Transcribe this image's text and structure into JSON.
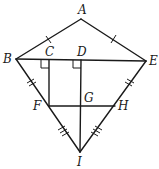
{
  "diagram": {
    "type": "kite-geometry",
    "points": {
      "A": {
        "label": "A",
        "x": 81,
        "y": 19
      },
      "B": {
        "label": "B",
        "x": 16,
        "y": 59
      },
      "C": {
        "label": "C",
        "x": 49,
        "y": 60
      },
      "D": {
        "label": "D",
        "x": 81,
        "y": 60
      },
      "E": {
        "label": "E",
        "x": 146,
        "y": 61
      },
      "F": {
        "label": "F",
        "x": 49,
        "y": 106
      },
      "G": {
        "label": "G",
        "x": 81,
        "y": 106
      },
      "H": {
        "label": "H",
        "x": 115,
        "y": 106
      },
      "I": {
        "label": "I",
        "x": 80,
        "y": 152
      }
    },
    "segments": [
      "AB",
      "AE",
      "BE",
      "BI",
      "EI",
      "CF",
      "DI",
      "FH"
    ],
    "congruence_marks": [
      {
        "segments": [
          "AB",
          "AE"
        ],
        "ticks": 1
      },
      {
        "segments": [
          "BF",
          "EH"
        ],
        "ticks": 2
      },
      {
        "segments": [
          "FI",
          "HI"
        ],
        "ticks": 3
      }
    ],
    "right_angles": [
      "C",
      "D"
    ]
  }
}
